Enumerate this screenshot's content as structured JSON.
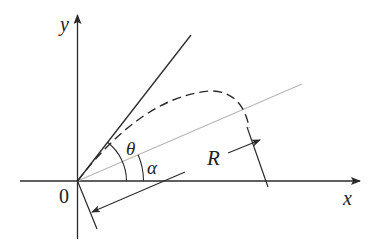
{
  "diagram": {
    "labels": {
      "y_axis": "y",
      "x_axis": "x",
      "origin": "0",
      "theta": "θ",
      "alpha": "α",
      "range": "R"
    },
    "colors": {
      "axis": "#2a2a2a",
      "launch_line": "#2a2a2a",
      "incline_line": "#b8b8b8",
      "trajectory": "#2a2a2a",
      "background": "#ffffff"
    }
  }
}
